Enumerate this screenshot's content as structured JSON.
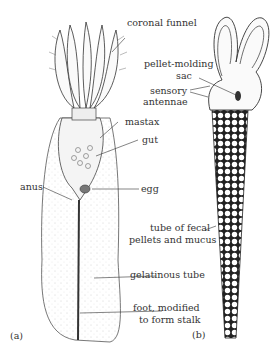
{
  "figure": {
    "panel_a": {
      "letter": "(a)",
      "labels": {
        "coronal_funnel": "coronal funnel",
        "mastax": "mastax",
        "gut": "gut",
        "anus": "anus",
        "egg": "egg",
        "gelatinous_tube": "gelatinous tube",
        "foot_line1": "foot, modified",
        "foot_line2": "to form stalk"
      }
    },
    "panel_b": {
      "letter": "(b)",
      "labels": {
        "pellet_line1": "pellet-molding",
        "pellet_line2": "sac",
        "sensory_line1": "sensory",
        "sensory_line2": "antennae",
        "tube_line1": "tube of fecal",
        "tube_line2": "pellets and mucus"
      }
    }
  }
}
